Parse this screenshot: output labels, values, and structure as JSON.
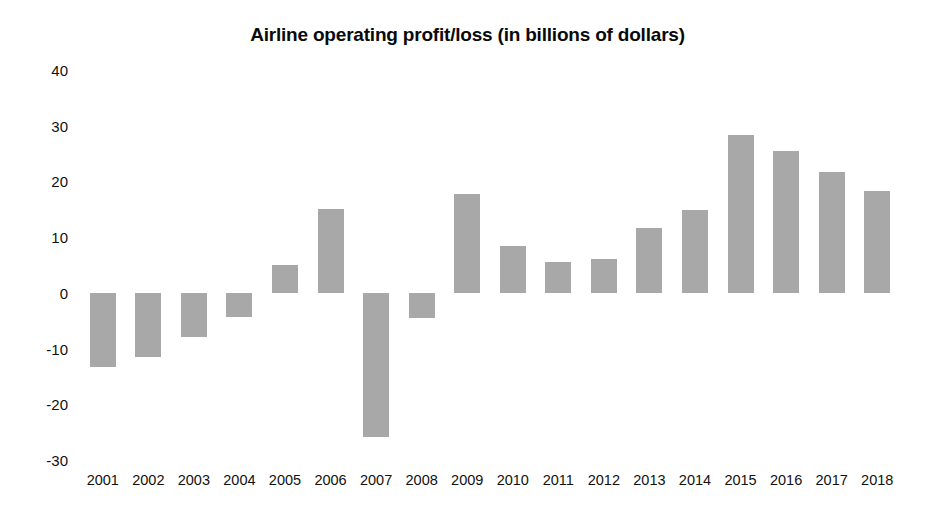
{
  "chart_data": {
    "type": "bar",
    "title": "Airline operating profit/loss (in billions of dollars)",
    "xlabel": "",
    "ylabel": "",
    "ylim": [
      -30,
      40
    ],
    "ytick_values": [
      40,
      30,
      20,
      10,
      0,
      -10,
      -20,
      -30
    ],
    "ytick_labels": [
      "40",
      "30",
      "20",
      "10",
      "0",
      "-10",
      "-20",
      "-30"
    ],
    "grid": false,
    "legend": "none",
    "bar_color": "#a8a8a8",
    "categories": [
      "2001",
      "2002",
      "2003",
      "2004",
      "2005",
      "2006",
      "2007",
      "2008",
      "2009",
      "2010",
      "2011",
      "2012",
      "2013",
      "2014",
      "2015",
      "2016",
      "2017",
      "2018"
    ],
    "values": [
      -13.3,
      -11.5,
      -7.9,
      -4.3,
      5.0,
      15.1,
      -25.8,
      -4.5,
      17.8,
      8.5,
      5.6,
      6.1,
      11.7,
      14.9,
      28.4,
      25.5,
      21.7,
      18.3
    ]
  }
}
